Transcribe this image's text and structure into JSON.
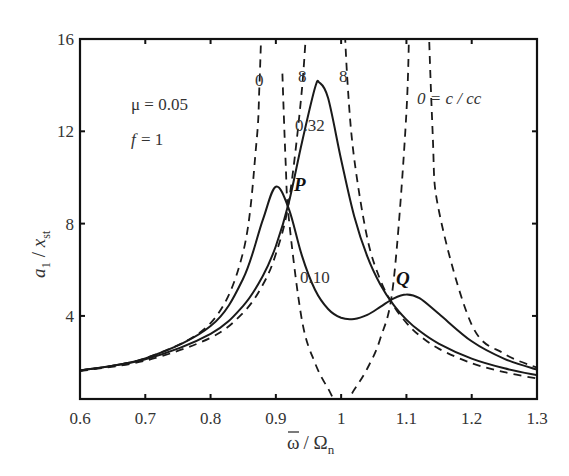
{
  "chart_data": {
    "type": "line",
    "title": "",
    "xlabel": "ω̄ / Ωn",
    "ylabel": "a1 / xst",
    "xlim": [
      0.6,
      1.3
    ],
    "ylim": [
      0.4,
      16
    ],
    "grid": false,
    "x_ticks": [
      "0.6",
      "0.7",
      "0.8",
      "0.9",
      "1",
      "1.1",
      "1.2",
      "1.3"
    ],
    "x_tick_values": [
      0.6,
      0.7,
      0.8,
      0.9,
      1.0,
      1.1,
      1.2,
      1.3
    ],
    "y_ticks": [
      "4",
      "8",
      "12",
      "16"
    ],
    "y_tick_values": [
      4,
      8,
      12,
      16
    ],
    "annotations": {
      "mu": "μ = 0.05",
      "f_label": "f",
      "f_value": "= 1",
      "label_zero_left": "0",
      "label_inf_left": "8",
      "label_inf_right": "8",
      "label_032": "0.32",
      "label_010": "0.10",
      "label_zero_right": "0 = c / cc",
      "point_P": "P",
      "point_Q": "Q"
    },
    "series": [
      {
        "name": "c/cc = 0.10",
        "style": "solid",
        "x": [
          0.6,
          0.7,
          0.8,
          0.85,
          0.88,
          0.9,
          0.92,
          0.94,
          0.96,
          0.98,
          1.0,
          1.02,
          1.04,
          1.06,
          1.08,
          1.1,
          1.12,
          1.15,
          1.2,
          1.25,
          1.3
        ],
        "values": [
          1.63,
          2.16,
          3.56,
          5.62,
          8.16,
          9.6,
          8.63,
          6.6,
          5.13,
          4.3,
          3.92,
          3.87,
          4.05,
          4.39,
          4.75,
          4.93,
          4.77,
          4.08,
          2.9,
          2.14,
          1.67
        ]
      },
      {
        "name": "c/cc = 0.32",
        "style": "solid",
        "x": [
          0.6,
          0.7,
          0.8,
          0.85,
          0.88,
          0.9,
          0.92,
          0.94,
          0.96,
          0.967,
          0.98,
          1.0,
          1.02,
          1.04,
          1.06,
          1.08,
          1.1,
          1.12,
          1.15,
          1.2,
          1.25,
          1.3
        ],
        "values": [
          1.63,
          2.12,
          3.22,
          4.44,
          5.73,
          7.03,
          8.93,
          11.53,
          13.89,
          14.1,
          13.44,
          10.78,
          8.32,
          6.58,
          5.36,
          4.49,
          3.84,
          3.35,
          2.79,
          2.15,
          1.73,
          1.43
        ]
      },
      {
        "name": "c/cc = 0 (branch 1)",
        "style": "dashed",
        "x": [
          0.6,
          0.7,
          0.8,
          0.85,
          0.87,
          0.875,
          0.88
        ],
        "values": [
          1.63,
          2.17,
          3.69,
          6.78,
          11.44,
          14.08,
          18.5
        ]
      },
      {
        "name": "c/cc = 0 (branch 2)",
        "style": "dashed",
        "x": [
          0.91,
          0.915,
          0.92,
          0.94,
          0.96,
          0.98,
          1.0,
          1.02,
          1.04,
          1.06,
          1.08,
          1.1,
          1.105
        ],
        "values": [
          14.5,
          10.6,
          8.2,
          3.8,
          1.96,
          0.85,
          0.0,
          0.8,
          1.72,
          3.02,
          5.43,
          12.8,
          18.1
        ]
      },
      {
        "name": "c/cc = 0 (branch 3)",
        "style": "dashed",
        "x": [
          1.125,
          1.13,
          1.14,
          1.15,
          1.2,
          1.25,
          1.3
        ],
        "values": [
          36.5,
          21.6,
          12.09,
          8.51,
          3.62,
          2.36,
          1.76
        ]
      },
      {
        "name": "c/cc = ∞ (branch 1)",
        "style": "dashed",
        "x": [
          0.6,
          0.7,
          0.8,
          0.85,
          0.88,
          0.9,
          0.92,
          0.94,
          0.95
        ],
        "values": [
          1.61,
          2.06,
          3.05,
          4.14,
          5.35,
          6.69,
          8.98,
          13.85,
          18.2
        ]
      },
      {
        "name": "c/cc = ∞ (branch 2)",
        "style": "dashed",
        "x": [
          1.003,
          1.01,
          1.02,
          1.04,
          1.06,
          1.08,
          1.1,
          1.12,
          1.15,
          1.2,
          1.25,
          1.3
        ],
        "values": [
          18.0,
          14.0,
          10.82,
          7.37,
          5.56,
          4.45,
          3.7,
          3.15,
          2.57,
          1.95,
          1.56,
          1.29
        ]
      }
    ],
    "legend": null
  },
  "layout": {
    "plot": {
      "left": 80,
      "top": 39,
      "right": 537,
      "bottom": 399
    },
    "line_color": "#1a1a1a"
  }
}
